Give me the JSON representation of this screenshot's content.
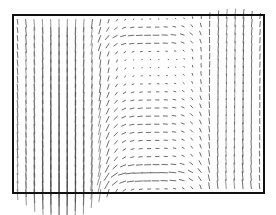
{
  "chart_data": {
    "type": "quiver",
    "title": "",
    "xlabel": "",
    "ylabel": "",
    "axes_frame": true,
    "ticks": false,
    "legend": null,
    "frame": {
      "x0": 13,
      "y0": 15,
      "x1": 264,
      "y1": 193
    },
    "grid": {
      "nx": 30,
      "ny": 22
    },
    "jet": {
      "center_x_frac": 0.19,
      "width_frac": 0.16,
      "strength": 1.0
    },
    "right_upflow": {
      "center_x_frac": 0.88,
      "width_frac": 0.14,
      "strength": 0.35
    },
    "colors": {
      "frame": "#111111",
      "arrow": "#333333",
      "background": "#ffffff"
    }
  }
}
